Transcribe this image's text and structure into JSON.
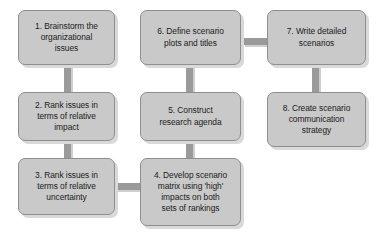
{
  "diagram": {
    "type": "flowchart",
    "orientation": "serpentine-three-column",
    "colors": {
      "node_fill": "#c9c9c9",
      "node_border": "#8e8e8e",
      "connector": "#9a9a9a",
      "shadow": "#d9d9d9",
      "background": "#ffffff",
      "text": "#1b1b1b"
    },
    "nodes": [
      {
        "id": "step-1",
        "number": "1",
        "label": "1. Brainstorm the\norganizational\nissues",
        "column": 1,
        "row": 1
      },
      {
        "id": "step-2",
        "number": "2",
        "label": "2. Rank issues in\nterms of relative\nimpact",
        "column": 1,
        "row": 2
      },
      {
        "id": "step-3",
        "number": "3",
        "label": "3. Rank issues in\nterms of relative\nuncertainty",
        "column": 1,
        "row": 3
      },
      {
        "id": "step-4",
        "number": "4",
        "label": "4. Develop scenario\nmatrix using 'high'\nimpacts on both\nsets of rankings",
        "column": 2,
        "row": 3
      },
      {
        "id": "step-5",
        "number": "5",
        "label": "5. Construct\nresearch agenda",
        "column": 2,
        "row": 2
      },
      {
        "id": "step-6",
        "number": "6",
        "label": "6. Define scenario\nplots and titles",
        "column": 2,
        "row": 1
      },
      {
        "id": "step-7",
        "number": "7",
        "label": "7. Write detailed\nscenarios",
        "column": 3,
        "row": 1
      },
      {
        "id": "step-8",
        "number": "8",
        "label": "8. Create scenario\ncommunication\nstrategy",
        "column": 3,
        "row": 2
      }
    ],
    "edges": [
      {
        "id": "edge-1-2",
        "from": "step-1",
        "to": "step-2",
        "direction": "down"
      },
      {
        "id": "edge-2-3",
        "from": "step-2",
        "to": "step-3",
        "direction": "down"
      },
      {
        "id": "edge-3-4",
        "from": "step-3",
        "to": "step-4",
        "direction": "right"
      },
      {
        "id": "edge-4-5",
        "from": "step-4",
        "to": "step-5",
        "direction": "up"
      },
      {
        "id": "edge-5-6",
        "from": "step-5",
        "to": "step-6",
        "direction": "up"
      },
      {
        "id": "edge-6-7",
        "from": "step-6",
        "to": "step-7",
        "direction": "right"
      },
      {
        "id": "edge-7-8",
        "from": "step-7",
        "to": "step-8",
        "direction": "down"
      }
    ]
  }
}
